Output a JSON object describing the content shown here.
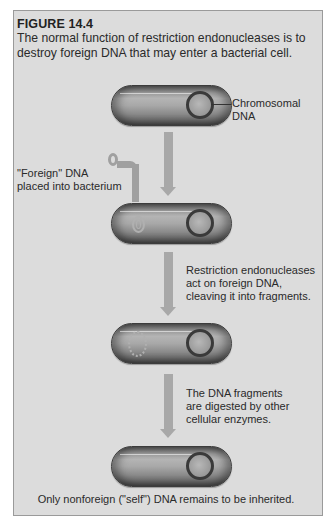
{
  "figure": {
    "number": "FIGURE 14.4",
    "caption_line1": "The normal function of restriction endonucleases is to",
    "caption_line2": "destroy foreign DNA that may enter a bacterial cell."
  },
  "labels": {
    "chromosomal_dna_1": "Chromosomal",
    "chromosomal_dna_2": "DNA",
    "foreign_dna_1": "\"Foreign\" DNA",
    "foreign_dna_2": "placed into bacterium",
    "step2_1": "Restriction endonucleases",
    "step2_2": "act on foreign DNA,",
    "step2_3": "cleaving it into fragments.",
    "step3_1": "The DNA fragments",
    "step3_2": "are digested by other",
    "step3_3": "cellular enzymes.",
    "final": "Only nonforeign (\"self\") DNA remains to be inherited."
  },
  "colors": {
    "panel_bg": "#dcdcdc",
    "panel_border": "#9a9a9a",
    "arrow": "#a8a8a8",
    "chromosome_ring": "#3a3a3a",
    "foreign_dna": "#a0a0a0",
    "text": "#2a2a2a"
  },
  "stages": [
    {
      "id": "stage-1",
      "description": "bacterium with chromosomal DNA"
    },
    {
      "id": "stage-2",
      "description": "foreign DNA inserted into bacterium"
    },
    {
      "id": "stage-3",
      "description": "foreign DNA cleaved into fragments"
    },
    {
      "id": "stage-4",
      "description": "only chromosomal DNA remains"
    }
  ]
}
